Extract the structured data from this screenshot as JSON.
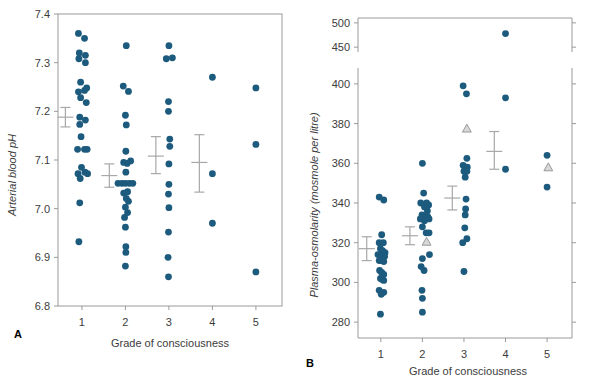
{
  "figure": {
    "marker_color": "#1d5b7e",
    "triangle_fill": "#d8d8d8",
    "triangle_stroke": "#9a9a9a",
    "error_bar_color": "#a8a8a8",
    "frame_color": "#9a9a9a"
  },
  "chart_data": [
    {
      "id": "panel-a",
      "type": "scatter",
      "panel_letter": "A",
      "title": "",
      "xlabel": "Grade of consciousness",
      "ylabel": "Arterial blood pH",
      "xlim": [
        0.45,
        5.6
      ],
      "ylim": [
        6.8,
        7.4
      ],
      "xticks": [
        1,
        2,
        3,
        4,
        5
      ],
      "xticklabels": [
        "1",
        "2",
        "3",
        "4",
        "5"
      ],
      "yticks": [
        6.8,
        6.9,
        7.0,
        7.1,
        7.2,
        7.3,
        7.4
      ],
      "yticklabels": [
        "6.8",
        "6.9",
        "7.0",
        "7.1",
        "7.2",
        "7.3",
        "7.4"
      ],
      "grid": false,
      "legend": "none",
      "axis_break": false,
      "series": [
        {
          "name": "Arterial blood pH by grade of consciousness",
          "marker": "circle",
          "points": [
            {
              "x": 0.92,
              "y": 7.36
            },
            {
              "x": 1.06,
              "y": 7.35
            },
            {
              "x": 0.94,
              "y": 7.32
            },
            {
              "x": 1.08,
              "y": 7.315
            },
            {
              "x": 0.93,
              "y": 7.308
            },
            {
              "x": 1.08,
              "y": 7.3
            },
            {
              "x": 0.97,
              "y": 7.26
            },
            {
              "x": 1.11,
              "y": 7.248
            },
            {
              "x": 0.92,
              "y": 7.24
            },
            {
              "x": 1.06,
              "y": 7.243
            },
            {
              "x": 0.97,
              "y": 7.228
            },
            {
              "x": 1.1,
              "y": 7.218
            },
            {
              "x": 0.95,
              "y": 7.188
            },
            {
              "x": 1.08,
              "y": 7.182
            },
            {
              "x": 0.95,
              "y": 7.173
            },
            {
              "x": 0.9,
              "y": 7.122
            },
            {
              "x": 0.98,
              "y": 7.148
            },
            {
              "x": 1.06,
              "y": 7.122
            },
            {
              "x": 1.12,
              "y": 7.122
            },
            {
              "x": 0.91,
              "y": 7.072
            },
            {
              "x": 0.99,
              "y": 7.085
            },
            {
              "x": 1.07,
              "y": 7.075
            },
            {
              "x": 1.13,
              "y": 7.072
            },
            {
              "x": 0.96,
              "y": 7.062
            },
            {
              "x": 0.95,
              "y": 7.012
            },
            {
              "x": 0.93,
              "y": 6.932
            },
            {
              "x": 2.02,
              "y": 7.335
            },
            {
              "x": 1.95,
              "y": 7.252
            },
            {
              "x": 2.07,
              "y": 7.241
            },
            {
              "x": 2.0,
              "y": 7.192
            },
            {
              "x": 2.02,
              "y": 7.172
            },
            {
              "x": 2.01,
              "y": 7.118
            },
            {
              "x": 1.96,
              "y": 7.095
            },
            {
              "x": 2.04,
              "y": 7.093
            },
            {
              "x": 2.12,
              "y": 7.098
            },
            {
              "x": 2.01,
              "y": 7.075
            },
            {
              "x": 1.83,
              "y": 7.052
            },
            {
              "x": 1.92,
              "y": 7.052
            },
            {
              "x": 2.0,
              "y": 7.052
            },
            {
              "x": 2.09,
              "y": 7.052
            },
            {
              "x": 2.17,
              "y": 7.052
            },
            {
              "x": 1.96,
              "y": 7.032
            },
            {
              "x": 2.05,
              "y": 7.035
            },
            {
              "x": 2.02,
              "y": 7.021
            },
            {
              "x": 2.07,
              "y": 7.015
            },
            {
              "x": 2.0,
              "y": 7.003
            },
            {
              "x": 1.98,
              "y": 6.982
            },
            {
              "x": 2.05,
              "y": 6.992
            },
            {
              "x": 2.0,
              "y": 6.962
            },
            {
              "x": 2.01,
              "y": 6.922
            },
            {
              "x": 2.01,
              "y": 6.91
            },
            {
              "x": 2.0,
              "y": 6.882
            }
          ]
        },
        {
          "name": "grade-3-and-above",
          "marker": "circle",
          "points": [
            {
              "x": 3.0,
              "y": 7.335
            },
            {
              "x": 2.94,
              "y": 7.308
            },
            {
              "x": 3.08,
              "y": 7.31
            },
            {
              "x": 2.99,
              "y": 7.22
            },
            {
              "x": 2.99,
              "y": 7.2
            },
            {
              "x": 3.02,
              "y": 7.143
            },
            {
              "x": 3.02,
              "y": 7.128
            },
            {
              "x": 3.0,
              "y": 7.092
            },
            {
              "x": 3.0,
              "y": 7.05
            },
            {
              "x": 2.99,
              "y": 7.03
            },
            {
              "x": 3.0,
              "y": 7.002
            },
            {
              "x": 2.99,
              "y": 6.952
            },
            {
              "x": 2.98,
              "y": 6.9
            },
            {
              "x": 2.99,
              "y": 6.86
            },
            {
              "x": 4.0,
              "y": 7.27
            },
            {
              "x": 4.0,
              "y": 7.072
            },
            {
              "x": 4.0,
              "y": 6.97
            },
            {
              "x": 5.0,
              "y": 7.248
            },
            {
              "x": 5.0,
              "y": 7.132
            },
            {
              "x": 5.0,
              "y": 6.87
            }
          ]
        }
      ],
      "error_bars": [
        {
          "x": 0.62,
          "mean": 7.188,
          "low": 7.168,
          "high": 7.208
        },
        {
          "x": 1.63,
          "mean": 7.068,
          "low": 7.044,
          "high": 7.092
        },
        {
          "x": 2.7,
          "mean": 7.108,
          "low": 7.072,
          "high": 7.148
        },
        {
          "x": 3.7,
          "mean": 7.095,
          "low": 7.034,
          "high": 7.152
        }
      ]
    },
    {
      "id": "panel-b",
      "type": "scatter",
      "panel_letter": "B",
      "title": "",
      "xlabel": "Grade of consciousness",
      "ylabel": "Plasma-osmolarity (mosmole per litre)",
      "xlim": [
        0.45,
        5.6
      ],
      "ylim": [
        272,
        408
      ],
      "ylim_upper": [
        440,
        510
      ],
      "xticks": [
        1,
        2,
        3,
        4,
        5
      ],
      "xticklabels": [
        "1",
        "2",
        "3",
        "4",
        "5"
      ],
      "yticks": [
        280,
        300,
        320,
        340,
        360,
        380,
        400
      ],
      "yticklabels": [
        "280",
        "300",
        "320",
        "340",
        "360",
        "380",
        "400"
      ],
      "yticks_upper": [
        450,
        500
      ],
      "yticklabels_upper": [
        "450",
        "500"
      ],
      "grid": false,
      "legend": "none",
      "axis_break": true,
      "series": [
        {
          "name": "Plasma-osmolarity grade 1",
          "marker": "circle",
          "points": [
            {
              "x": 0.96,
              "y": 343
            },
            {
              "x": 1.07,
              "y": 341.5
            },
            {
              "x": 1.02,
              "y": 324
            },
            {
              "x": 0.96,
              "y": 320
            },
            {
              "x": 1.06,
              "y": 320
            },
            {
              "x": 0.99,
              "y": 317
            },
            {
              "x": 1.04,
              "y": 316
            },
            {
              "x": 1.1,
              "y": 315
            },
            {
              "x": 0.93,
              "y": 314
            },
            {
              "x": 0.99,
              "y": 314
            },
            {
              "x": 1.04,
              "y": 313.5
            },
            {
              "x": 1.09,
              "y": 313
            },
            {
              "x": 0.96,
              "y": 311
            },
            {
              "x": 1.02,
              "y": 311
            },
            {
              "x": 1.07,
              "y": 310.5
            },
            {
              "x": 0.97,
              "y": 306
            },
            {
              "x": 1.02,
              "y": 305
            },
            {
              "x": 1.07,
              "y": 304
            },
            {
              "x": 0.99,
              "y": 302
            },
            {
              "x": 1.03,
              "y": 301.5
            },
            {
              "x": 1.07,
              "y": 301
            },
            {
              "x": 0.96,
              "y": 296
            },
            {
              "x": 1.07,
              "y": 295
            },
            {
              "x": 1.01,
              "y": 294
            },
            {
              "x": 0.99,
              "y": 284
            }
          ]
        },
        {
          "name": "Plasma-osmolarity grade 2",
          "marker": "circle",
          "points": [
            {
              "x": 2.0,
              "y": 360
            },
            {
              "x": 2.03,
              "y": 345
            },
            {
              "x": 1.96,
              "y": 340
            },
            {
              "x": 2.1,
              "y": 340
            },
            {
              "x": 2.15,
              "y": 339
            },
            {
              "x": 2.05,
              "y": 338
            },
            {
              "x": 2.12,
              "y": 336
            },
            {
              "x": 1.99,
              "y": 334
            },
            {
              "x": 2.07,
              "y": 333.5
            },
            {
              "x": 2.13,
              "y": 333
            },
            {
              "x": 1.95,
              "y": 332
            },
            {
              "x": 2.05,
              "y": 331
            },
            {
              "x": 2.16,
              "y": 332
            },
            {
              "x": 2.0,
              "y": 328
            },
            {
              "x": 2.09,
              "y": 325
            },
            {
              "x": 2.16,
              "y": 325
            },
            {
              "x": 2.17,
              "y": 314
            },
            {
              "x": 2.0,
              "y": 312
            },
            {
              "x": 1.97,
              "y": 308
            },
            {
              "x": 2.04,
              "y": 306
            },
            {
              "x": 1.99,
              "y": 296
            },
            {
              "x": 2.0,
              "y": 292
            },
            {
              "x": 2.0,
              "y": 285
            }
          ]
        },
        {
          "name": "Plasma-osmolarity grade 3+",
          "marker": "circle",
          "points": [
            {
              "x": 2.98,
              "y": 399
            },
            {
              "x": 3.06,
              "y": 395
            },
            {
              "x": 3.07,
              "y": 362.5
            },
            {
              "x": 2.98,
              "y": 359
            },
            {
              "x": 3.08,
              "y": 358
            },
            {
              "x": 3.0,
              "y": 356
            },
            {
              "x": 3.07,
              "y": 356
            },
            {
              "x": 3.03,
              "y": 353
            },
            {
              "x": 3.05,
              "y": 342
            },
            {
              "x": 3.04,
              "y": 337
            },
            {
              "x": 3.03,
              "y": 334
            },
            {
              "x": 3.02,
              "y": 327.5
            },
            {
              "x": 3.07,
              "y": 322
            },
            {
              "x": 2.97,
              "y": 320
            },
            {
              "x": 3.0,
              "y": 305.5
            },
            {
              "x": 4.0,
              "y": 393
            },
            {
              "x": 4.0,
              "y": 357
            },
            {
              "x": 5.0,
              "y": 364
            },
            {
              "x": 5.0,
              "y": 348
            }
          ]
        },
        {
          "name": "Plasma-osmolarity upper-segment outlier",
          "marker": "circle",
          "segment": "upper",
          "points": [
            {
              "x": 4.0,
              "y": 478
            }
          ]
        },
        {
          "name": "Plasma-osmolarity triangles",
          "marker": "triangle",
          "points": [
            {
              "x": 2.1,
              "y": 320.5
            },
            {
              "x": 3.07,
              "y": 377.5
            },
            {
              "x": 5.03,
              "y": 358
            }
          ]
        }
      ],
      "error_bars": [
        {
          "x": 0.66,
          "mean": 317,
          "low": 311,
          "high": 323
        },
        {
          "x": 1.7,
          "mean": 323.5,
          "low": 319,
          "high": 328
        },
        {
          "x": 2.72,
          "mean": 342.5,
          "low": 336.5,
          "high": 348.5
        },
        {
          "x": 3.73,
          "mean": 366,
          "low": 357,
          "high": 376
        }
      ]
    }
  ]
}
